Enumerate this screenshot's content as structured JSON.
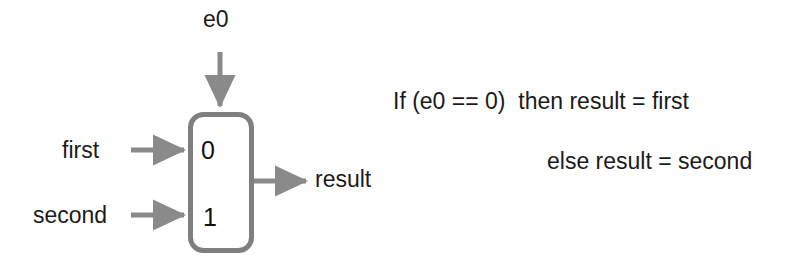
{
  "diagram": {
    "kind": "logic-diagram",
    "colors": {
      "wire": "#8a8a8a",
      "box_border": "#7f7f7f",
      "box_fill": "#ffffff",
      "text": "#1a1a1a",
      "background": "#ffffff"
    },
    "mux": {
      "shape": "rounded-rectangle",
      "border_width_px": 5,
      "corner_radius_px": 13,
      "x": 188,
      "y": 112,
      "width": 64,
      "height": 141,
      "port_labels": {
        "top": "0",
        "bottom": "1"
      }
    },
    "signals": {
      "select_label": "e0",
      "input_top_label": "first",
      "input_bottom_label": "second",
      "output_label": "result"
    },
    "arrows": [
      {
        "name": "select-arrow",
        "from_label": "e0",
        "to": "mux-top",
        "direction": "down"
      },
      {
        "name": "input-first-arrow",
        "from_label": "first",
        "to": "mux-port-0",
        "direction": "right"
      },
      {
        "name": "input-second-arrow",
        "from_label": "second",
        "to": "mux-port-1",
        "direction": "right"
      },
      {
        "name": "output-result-arrow",
        "from": "mux-right",
        "to_label": "result",
        "direction": "right"
      }
    ]
  },
  "pseudocode": {
    "line1": "If (e0 == 0)  then result = first",
    "line2": "else result = second"
  }
}
